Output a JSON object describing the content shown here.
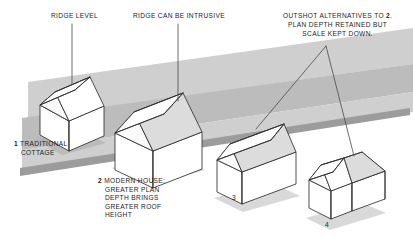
{
  "diagram": {
    "type": "architectural-axonometric-diagram",
    "background_color": "#ffffff",
    "ink_color": "#2b2b2b",
    "ground_band_color": "#b9b9b9",
    "shadow_color": "#a8a8a8",
    "roof_shade_color": "#d9d9d9"
  },
  "annotations": {
    "ridge_level": {
      "text": "RIDGE LEVEL",
      "leader": "vertical-line-down-to-house-1-ridge"
    },
    "ridge_intrusive": {
      "text": "RIDGE CAN BE INTRUSIVE",
      "leader": "vertical-line-down-to-house-2-ridge"
    },
    "outshot": {
      "line1": "OUTSHOT ALTERNATIVES TO ",
      "line1_num": "2",
      "line1_end": ".",
      "line2": "PLAN DEPTH RETAINED BUT",
      "line3": "SCALE KEPT DOWN.",
      "leader": "two-diverging-lines-to-house-3-and-house-4"
    }
  },
  "callouts": [
    {
      "number": "1",
      "lines": [
        "TRADITIONAL",
        "COTTAGE"
      ],
      "subject": "house-1"
    },
    {
      "number": "2",
      "lines": [
        "MODERN HOUSE:",
        "GREATER PLAN",
        "DEPTH BRINGS",
        "GREATER ROOF",
        "HEIGHT"
      ],
      "subject": "house-2"
    },
    {
      "number": "3",
      "lines": [],
      "subject": "house-3"
    },
    {
      "number": "4",
      "lines": [],
      "subject": "house-4"
    }
  ],
  "houses": [
    {
      "id": "house-1",
      "label": "traditional-cottage",
      "description": "Small shallow-plan cottage with symmetrical gable roof, lowest ridge"
    },
    {
      "id": "house-2",
      "label": "modern-house",
      "description": "Deeper plan, symmetrical gable, tallest and most intrusive ridge"
    },
    {
      "id": "house-3",
      "label": "outshot-catslide",
      "description": "Deep plan with asymmetric catslide outshot roof, ridge kept low"
    },
    {
      "id": "house-4",
      "label": "cross-gable",
      "description": "Deep plan broken into cross gable wing, ridge kept low"
    }
  ]
}
